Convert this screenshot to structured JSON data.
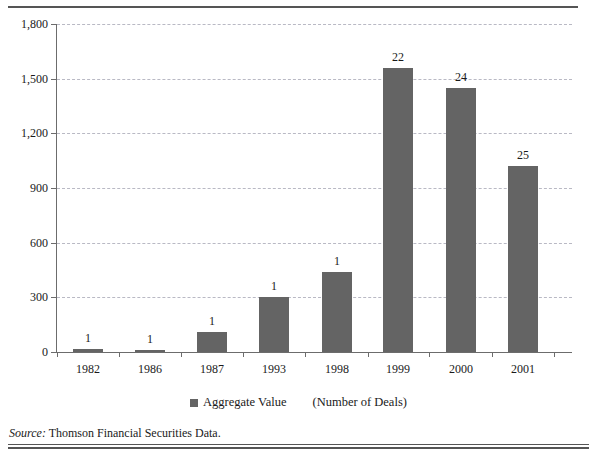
{
  "chart_data": {
    "type": "bar",
    "title": "",
    "xlabel": "",
    "ylabel": "",
    "categories": [
      "1982",
      "1986",
      "1987",
      "1993",
      "1998",
      "1999",
      "2000",
      "2001"
    ],
    "values": [
      15,
      10,
      110,
      300,
      440,
      1560,
      1450,
      1020
    ],
    "point_labels": [
      "1",
      "1",
      "1",
      "1",
      "1",
      "22",
      "24",
      "25"
    ],
    "series": [
      {
        "name": "Aggregate Value",
        "values": [
          15,
          10,
          110,
          300,
          440,
          1560,
          1450,
          1020
        ]
      }
    ],
    "ylim": [
      0,
      1800
    ],
    "yticks": [
      0,
      300,
      600,
      900,
      1200,
      1500,
      1800
    ],
    "ytick_labels": [
      "0",
      "300",
      "600",
      "900",
      "1,200",
      "1,500",
      "1,800"
    ],
    "grid": true,
    "legend_position": "bottom",
    "bar_color": "#646464",
    "gridline_color": "#b9b9c4",
    "axis_color": "#6c6c6c"
  },
  "legend": {
    "swatch_name": "aggregate-value-swatch",
    "label": "Aggregate Value",
    "note": "(Number of Deals)"
  },
  "source": {
    "prefix": "Source:",
    "text": "Thomson Financial Securities Data."
  }
}
